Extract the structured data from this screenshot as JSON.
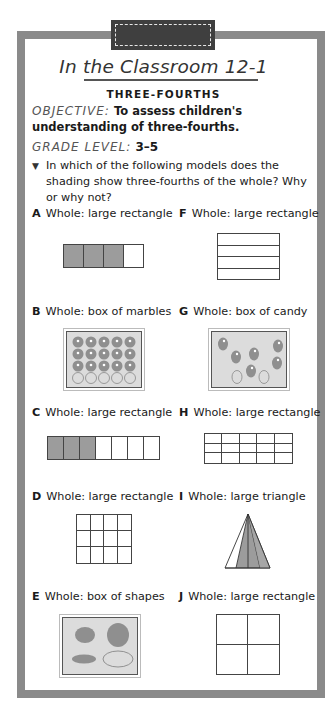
{
  "header": {
    "title": "In the Classroom 12-1",
    "subtitle": "THREE-FOURTHS"
  },
  "objective": {
    "label": "OBJECTIVE:",
    "text": "To assess children's understanding of three-fourths."
  },
  "grade_level": {
    "label": "GRADE LEVEL:",
    "value": "3–5"
  },
  "question": {
    "bullet": "▼",
    "text": "In which of the following models does the shading show three-fourths of the whole? Why or why not?"
  },
  "items": [
    {
      "letter": "A",
      "text": "Whole: large rectangle",
      "model": "4 vertical cells, 3 shaded"
    },
    {
      "letter": "B",
      "text": "Whole: box of marbles",
      "model": "20 marbles, 15 shaded"
    },
    {
      "letter": "C",
      "text": "Whole: large rectangle",
      "model": "7 vertical cells, 3 shaded"
    },
    {
      "letter": "D",
      "text": "Whole: large rectangle",
      "model": "4x3 grid, 9 shaded"
    },
    {
      "letter": "E",
      "text": "Whole: box of shapes",
      "model": "4 shapes, 3 shaded"
    },
    {
      "letter": "F",
      "text": "Whole: large rectangle",
      "model": "4 horizontal strips, 3 shaded"
    },
    {
      "letter": "G",
      "text": "Whole: box of candy",
      "model": "8 candies, 6 shaded"
    },
    {
      "letter": "H",
      "text": "Whole: large rectangle",
      "model": "5x3 grid, 14 shaded"
    },
    {
      "letter": "I",
      "text": "Whole: large triangle",
      "model": "triangle split into 4 unequal parts, 3 shaded"
    },
    {
      "letter": "J",
      "text": "Whole: large rectangle",
      "model": "2x2 grid, 3 shaded"
    }
  ],
  "colors": {
    "frame": "#8a8a8a",
    "tab": "#3f3f3f",
    "shade": "#9c9c9c",
    "box_fill": "#dcdcdc"
  }
}
